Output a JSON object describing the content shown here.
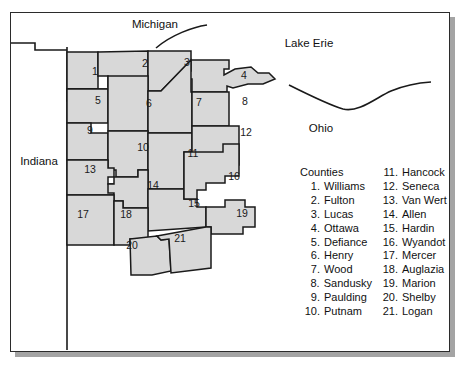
{
  "figure": {
    "fill_color": "#d8d8d8",
    "stroke_color": "#1a1a1a",
    "background": "#ffffff"
  },
  "map_labels": {
    "michigan": "Michigan",
    "lake_erie": "Lake Erie",
    "ohio": "Ohio",
    "indiana": "Indiana"
  },
  "legend": {
    "title": "Counties",
    "column_left": [
      {
        "num": "1.",
        "name": "Williams"
      },
      {
        "num": "2.",
        "name": "Fulton"
      },
      {
        "num": "3.",
        "name": "Lucas"
      },
      {
        "num": "4.",
        "name": "Ottawa"
      },
      {
        "num": "5.",
        "name": "Defiance"
      },
      {
        "num": "6.",
        "name": "Henry"
      },
      {
        "num": "7.",
        "name": "Wood"
      },
      {
        "num": "8.",
        "name": "Sandusky"
      },
      {
        "num": "9.",
        "name": "Paulding"
      },
      {
        "num": "10.",
        "name": "Putnam"
      }
    ],
    "column_right": [
      {
        "num": "11.",
        "name": "Hancock"
      },
      {
        "num": "12.",
        "name": "Seneca"
      },
      {
        "num": "13.",
        "name": "Van Wert"
      },
      {
        "num": "14.",
        "name": "Allen"
      },
      {
        "num": "15.",
        "name": "Hardin"
      },
      {
        "num": "16.",
        "name": "Wyandot"
      },
      {
        "num": "17.",
        "name": "Mercer"
      },
      {
        "num": "18.",
        "name": "Auglazia"
      },
      {
        "num": "19.",
        "name": "Marion"
      },
      {
        "num": "20.",
        "name": "Shelby"
      },
      {
        "num": "21.",
        "name": "Logan"
      }
    ]
  },
  "county_numbers": [
    {
      "id": "1",
      "x": 94,
      "y": 70
    },
    {
      "id": "2",
      "x": 144,
      "y": 62
    },
    {
      "id": "3",
      "x": 186,
      "y": 61
    },
    {
      "id": "4",
      "x": 243,
      "y": 71
    },
    {
      "id": "5",
      "x": 97,
      "y": 98
    },
    {
      "id": "6",
      "x": 148,
      "y": 102
    },
    {
      "id": "7",
      "x": 198,
      "y": 101
    },
    {
      "id": "8",
      "x": 244,
      "y": 99
    },
    {
      "id": "9",
      "x": 89,
      "y": 128
    },
    {
      "id": "10",
      "x": 142,
      "y": 145
    },
    {
      "id": "11",
      "x": 192,
      "y": 151
    },
    {
      "id": "12",
      "x": 245,
      "y": 130
    },
    {
      "id": "13",
      "x": 89,
      "y": 167
    },
    {
      "id": "14",
      "x": 152,
      "y": 183
    },
    {
      "id": "15",
      "x": 193,
      "y": 201
    },
    {
      "id": "16",
      "x": 233,
      "y": 174
    },
    {
      "id": "17",
      "x": 82,
      "y": 212
    },
    {
      "id": "18",
      "x": 125,
      "y": 212
    },
    {
      "id": "19",
      "x": 241,
      "y": 211
    },
    {
      "id": "20",
      "x": 131,
      "y": 243
    },
    {
      "id": "21",
      "x": 179,
      "y": 236
    }
  ]
}
